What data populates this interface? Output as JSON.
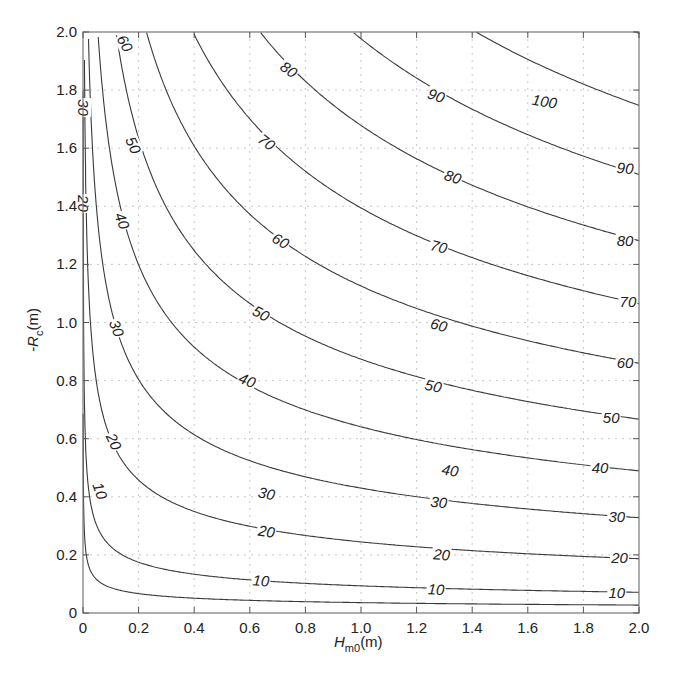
{
  "chart_data": {
    "type": "contour",
    "title": "",
    "xlabel": "H_m0(m)",
    "xlabel_main": "H",
    "xlabel_sub": "m0",
    "xlabel_unit": "(m)",
    "ylabel": "-R_c(m)",
    "ylabel_prefix": "-R",
    "ylabel_sub": "c",
    "ylabel_unit": "(m)",
    "xlim": [
      0,
      2.0
    ],
    "ylim": [
      0,
      2.0
    ],
    "grid": true,
    "grid_style": "dotted",
    "x_ticks": [
      "0",
      "0.2",
      "0.4",
      "0.6",
      "0.8",
      "1.0",
      "1.2",
      "1.4",
      "1.6",
      "1.8",
      "2.0"
    ],
    "y_ticks": [
      "0",
      "0.2",
      "0.4",
      "0.6",
      "0.8",
      "1.0",
      "1.2",
      "1.4",
      "1.6",
      "1.8",
      "2.0"
    ],
    "levels": [
      5,
      10,
      20,
      30,
      40,
      50,
      60,
      70,
      80,
      90,
      100,
      110
    ],
    "model": {
      "form": "K * H^a * R^b",
      "K": 55.1,
      "a": 0.28,
      "b": 0.72
    },
    "contour_crossings": {
      "right_edge_H2.0": {
        "10": 0.07,
        "20": 0.19,
        "30": 0.33,
        "40": 0.49,
        "50": 0.67,
        "60": 0.86,
        "70": 1.06,
        "80": 1.28,
        "90": 1.51,
        "100": 1.75
      },
      "top_edge_R2.0": {
        "30": 0.02,
        "40": 0.05,
        "50": 0.12,
        "60": 0.23,
        "70": 0.4,
        "80": 0.64,
        "90": 0.91,
        "100": 1.4
      }
    },
    "contour_labels": [
      {
        "text": "10",
        "x": 0.06,
        "y": 0.42,
        "rot": 70
      },
      {
        "text": "10",
        "x": 0.64,
        "y": 0.11,
        "rot": 5
      },
      {
        "text": "10",
        "x": 1.27,
        "y": 0.08,
        "rot": 3
      },
      {
        "text": "10",
        "x": 1.92,
        "y": 0.07,
        "rot": 0
      },
      {
        "text": "20",
        "x": 0.11,
        "y": 0.59,
        "rot": 65
      },
      {
        "text": "20",
        "x": 0.66,
        "y": 0.28,
        "rot": 8
      },
      {
        "text": "20",
        "x": 1.29,
        "y": 0.2,
        "rot": 4
      },
      {
        "text": "20",
        "x": 1.93,
        "y": 0.19,
        "rot": 0
      },
      {
        "text": "20",
        "x": 0.0,
        "y": 1.41,
        "rot": 90
      },
      {
        "text": "30",
        "x": 0.0,
        "y": 1.74,
        "rot": 90
      },
      {
        "text": "30",
        "x": 0.12,
        "y": 0.98,
        "rot": 70
      },
      {
        "text": "30",
        "x": 0.66,
        "y": 0.41,
        "rot": 12
      },
      {
        "text": "30",
        "x": 1.28,
        "y": 0.38,
        "rot": 6
      },
      {
        "text": "30",
        "x": 1.92,
        "y": 0.33,
        "rot": 0
      },
      {
        "text": "40",
        "x": 0.14,
        "y": 1.35,
        "rot": 70
      },
      {
        "text": "40",
        "x": 0.59,
        "y": 0.8,
        "rot": 22
      },
      {
        "text": "40",
        "x": 1.32,
        "y": 0.49,
        "rot": 10
      },
      {
        "text": "40",
        "x": 1.86,
        "y": 0.5,
        "rot": 0
      },
      {
        "text": "50",
        "x": 0.18,
        "y": 1.61,
        "rot": 65
      },
      {
        "text": "50",
        "x": 0.64,
        "y": 1.03,
        "rot": 28
      },
      {
        "text": "50",
        "x": 1.26,
        "y": 0.78,
        "rot": 12
      },
      {
        "text": "50",
        "x": 1.9,
        "y": 0.67,
        "rot": 0
      },
      {
        "text": "60",
        "x": 0.15,
        "y": 1.96,
        "rot": 60
      },
      {
        "text": "60",
        "x": 0.71,
        "y": 1.28,
        "rot": 30
      },
      {
        "text": "60",
        "x": 1.28,
        "y": 0.99,
        "rot": 15
      },
      {
        "text": "60",
        "x": 1.95,
        "y": 0.86,
        "rot": 0
      },
      {
        "text": "70",
        "x": 0.66,
        "y": 1.62,
        "rot": 38
      },
      {
        "text": "70",
        "x": 1.28,
        "y": 1.26,
        "rot": 15
      },
      {
        "text": "70",
        "x": 1.96,
        "y": 1.07,
        "rot": 0
      },
      {
        "text": "80",
        "x": 0.74,
        "y": 1.87,
        "rot": 35
      },
      {
        "text": "80",
        "x": 1.33,
        "y": 1.5,
        "rot": 18
      },
      {
        "text": "80",
        "x": 1.95,
        "y": 1.28,
        "rot": 0
      },
      {
        "text": "90",
        "x": 1.27,
        "y": 1.78,
        "rot": 20
      },
      {
        "text": "90",
        "x": 1.95,
        "y": 1.53,
        "rot": 5
      },
      {
        "text": "100",
        "x": 1.66,
        "y": 1.76,
        "rot": 10
      }
    ]
  },
  "colors": {
    "line": "#3a3a3a",
    "axis": "#555555",
    "grid": "#c8c8c8",
    "text": "#222222",
    "background": "#ffffff"
  }
}
